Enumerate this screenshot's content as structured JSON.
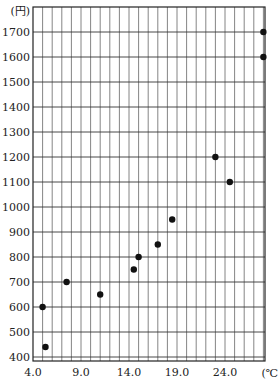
{
  "chart_data": {
    "type": "scatter",
    "title": "",
    "xlabel": "(℃)",
    "ylabel": "(円)",
    "xlim": [
      4.0,
      28.2
    ],
    "ylim": [
      380,
      1800
    ],
    "x_ticks": [
      "4.0",
      "9.0",
      "14.0",
      "19.0",
      "24.0"
    ],
    "y_ticks": [
      "400",
      "500",
      "600",
      "700",
      "800",
      "900",
      "1000",
      "1100",
      "1200",
      "1300",
      "1400",
      "1500",
      "1600",
      "1700"
    ],
    "grid": true,
    "legend": null,
    "points": [
      {
        "x": 5.0,
        "y": 600
      },
      {
        "x": 5.3,
        "y": 440
      },
      {
        "x": 7.5,
        "y": 700
      },
      {
        "x": 11.0,
        "y": 650
      },
      {
        "x": 14.5,
        "y": 750
      },
      {
        "x": 15.0,
        "y": 800
      },
      {
        "x": 17.0,
        "y": 850
      },
      {
        "x": 18.5,
        "y": 950
      },
      {
        "x": 23.0,
        "y": 1200
      },
      {
        "x": 24.5,
        "y": 1100
      },
      {
        "x": 28.0,
        "y": 1700
      },
      {
        "x": 28.0,
        "y": 1600
      }
    ]
  }
}
